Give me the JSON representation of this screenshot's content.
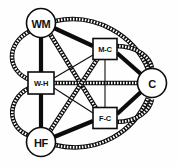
{
  "diagram": {
    "type": "path-diagram",
    "background_color": "#fefefe",
    "stroke_color": "#0c0c0c",
    "node_fill": "#ffffff",
    "nodes": [
      {
        "id": "WM",
        "label": "WM",
        "shape": "circle",
        "cx": 41,
        "cy": 23,
        "r": 14.5,
        "label_class": "lbl-lg"
      },
      {
        "id": "WH",
        "label": "W-H",
        "shape": "square",
        "cx": 41,
        "cy": 83,
        "w": 26,
        "h": 22,
        "label_class": "lbl-sm"
      },
      {
        "id": "HF",
        "label": "HF",
        "shape": "circle",
        "cx": 41,
        "cy": 142,
        "r": 14.5,
        "label_class": "lbl-lg"
      },
      {
        "id": "MC",
        "label": "M-C",
        "shape": "square",
        "cx": 105,
        "cy": 49,
        "w": 24,
        "h": 21,
        "label_class": "lbl-sm"
      },
      {
        "id": "FC",
        "label": "F-C",
        "shape": "square",
        "cx": 105,
        "cy": 118,
        "w": 24,
        "h": 21,
        "label_class": "lbl-sm"
      },
      {
        "id": "C",
        "label": "C",
        "shape": "circle",
        "cx": 152,
        "cy": 83,
        "r": 14.5,
        "label_class": "lbl-lg"
      }
    ],
    "edge_styles": {
      "thick": {
        "name": "thick-solid",
        "width": 4.2,
        "pattern": "solid"
      },
      "thin": {
        "name": "thin-solid",
        "width": 1.1,
        "pattern": "solid"
      },
      "hatch": {
        "name": "hatched-ladder",
        "width": 4.6,
        "pattern": "hatched"
      }
    },
    "edges": [
      {
        "id": "wm-wh-straight",
        "from": "WM",
        "to": "WH",
        "style": "thick",
        "shape": "line",
        "path": "M 41 37.5 L 41 72"
      },
      {
        "id": "wm-wh-curve",
        "from": "WM",
        "to": "WH",
        "style": "hatch",
        "shape": "curve",
        "path": "M 30 31 C 6 44 6 70 30 80"
      },
      {
        "id": "wh-hf-straight",
        "from": "WH",
        "to": "HF",
        "style": "thick",
        "shape": "line",
        "path": "M 41 94 L 41 127.5"
      },
      {
        "id": "wh-hf-curve",
        "from": "WH",
        "to": "HF",
        "style": "hatch",
        "shape": "curve",
        "path": "M 29 88 C 6 100 7 128 30 136"
      },
      {
        "id": "wm-mc",
        "from": "WM",
        "to": "MC",
        "style": "thick",
        "shape": "line",
        "path": "M 54 28 L 93 46"
      },
      {
        "id": "wm-fc",
        "from": "WM",
        "to": "FC",
        "style": "hatch",
        "shape": "line",
        "path": "M 50 34 L 97 110"
      },
      {
        "id": "wm-c",
        "from": "WM",
        "to": "C",
        "style": "hatch",
        "shape": "curve",
        "path": "M 55 21 C 96 12 134 36 148 69"
      },
      {
        "id": "wh-mc",
        "from": "WH",
        "to": "MC",
        "style": "thin",
        "shape": "line",
        "path": "M 54 78 L 93 55"
      },
      {
        "id": "wh-fc",
        "from": "WH",
        "to": "FC",
        "style": "thin",
        "shape": "line",
        "path": "M 54 88 L 93 113"
      },
      {
        "id": "wh-c",
        "from": "WH",
        "to": "C",
        "style": "hatch",
        "shape": "line",
        "path": "M 54 83 L 138 83"
      },
      {
        "id": "hf-mc",
        "from": "HF",
        "to": "MC",
        "style": "hatch",
        "shape": "line",
        "path": "M 50 131 L 98 58"
      },
      {
        "id": "hf-fc",
        "from": "HF",
        "to": "FC",
        "style": "thick",
        "shape": "line",
        "path": "M 54 137 L 93 121"
      },
      {
        "id": "hf-c",
        "from": "HF",
        "to": "C",
        "style": "hatch",
        "shape": "curve",
        "path": "M 55 145 C 97 155 134 132 148 98"
      },
      {
        "id": "mc-fc",
        "from": "MC",
        "to": "FC",
        "style": "thin",
        "shape": "line",
        "path": "M 105 60 L 105 107"
      },
      {
        "id": "mc-c",
        "from": "MC",
        "to": "C",
        "style": "thick",
        "shape": "line",
        "path": "M 117 53 L 142 75"
      },
      {
        "id": "mc-c-curve",
        "from": "MC",
        "to": "C",
        "style": "hatch",
        "shape": "curve",
        "path": "M 116 46 C 138 46 150 58 152 68"
      },
      {
        "id": "fc-c",
        "from": "FC",
        "to": "C",
        "style": "thick",
        "shape": "line",
        "path": "M 117 114 L 142 91"
      },
      {
        "id": "fc-c-curve",
        "from": "FC",
        "to": "C",
        "style": "hatch",
        "shape": "curve",
        "path": "M 116 122 C 138 122 150 110 152 99"
      }
    ]
  }
}
